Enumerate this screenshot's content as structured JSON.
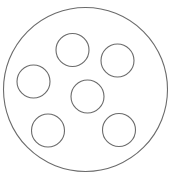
{
  "diagram": {
    "stroke_color": "#6b6b6b",
    "background": "#ffffff",
    "outer_circle": {
      "cx": 85.5,
      "cy": 89.5,
      "r": 82
    },
    "inner_circles": [
      {
        "cx": 72.5,
        "cy": 50,
        "r": 16.5
      },
      {
        "cx": 117.5,
        "cy": 60.5,
        "r": 16.5
      },
      {
        "cx": 33.5,
        "cy": 81.5,
        "r": 16.5
      },
      {
        "cx": 87.5,
        "cy": 96.5,
        "r": 16.5
      },
      {
        "cx": 48,
        "cy": 130.5,
        "r": 16.5
      },
      {
        "cx": 119,
        "cy": 130,
        "r": 16.5
      }
    ],
    "caption": ""
  }
}
